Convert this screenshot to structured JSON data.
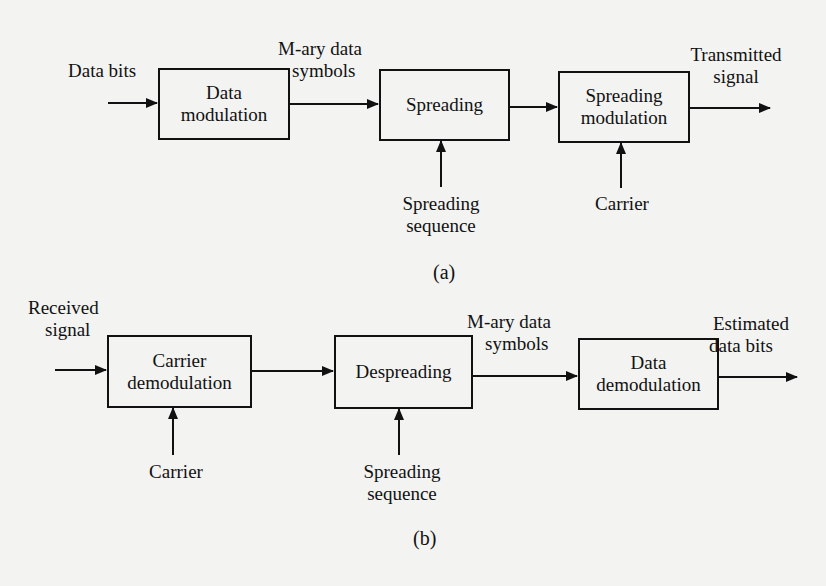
{
  "figure": {
    "panel_a": {
      "caption": "(a)",
      "input_label": "Data bits",
      "blocks": [
        {
          "line1": "Data",
          "line2": "modulation"
        },
        {
          "line1": "Spreading",
          "line2": ""
        },
        {
          "line1": "Spreading",
          "line2": "modulation"
        }
      ],
      "edge_label_1": {
        "line1": "M-ary data",
        "line2": "symbols"
      },
      "output_label": {
        "line1": "Transmitted",
        "line2": "signal"
      },
      "side_inputs": [
        {
          "line1": "Spreading",
          "line2": "sequence"
        },
        {
          "line1": "Carrier",
          "line2": ""
        }
      ]
    },
    "panel_b": {
      "caption": "(b)",
      "input_label": {
        "line1": "Received",
        "line2": "signal"
      },
      "blocks": [
        {
          "line1": "Carrier",
          "line2": "demodulation"
        },
        {
          "line1": "Despreading",
          "line2": ""
        },
        {
          "line1": "Data",
          "line2": "demodulation"
        }
      ],
      "edge_label_2": {
        "line1": "M-ary data",
        "line2": "symbols"
      },
      "output_label": {
        "line1": "Estimated",
        "line2": "data bits"
      },
      "side_inputs": [
        {
          "line1": "Carrier",
          "line2": ""
        },
        {
          "line1": "Spreading",
          "line2": "sequence"
        }
      ]
    },
    "colors": {
      "background": "#f3f3f1",
      "ink": "#111111"
    }
  }
}
